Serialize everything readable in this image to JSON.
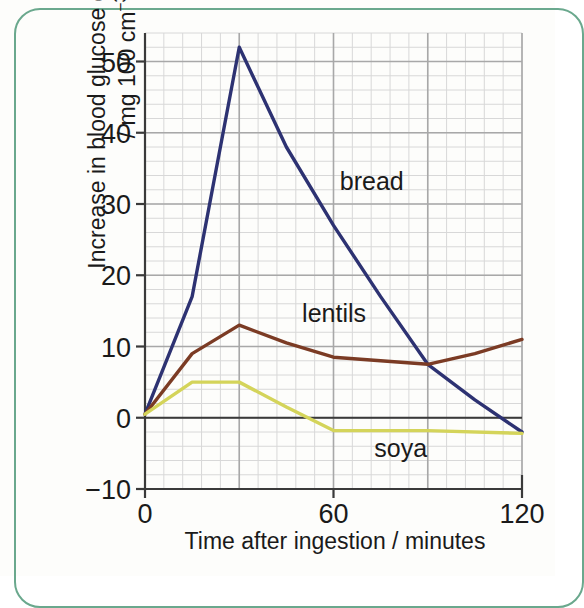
{
  "figure": {
    "frame_color": "#6aa88d",
    "background": "#fdfdfb"
  },
  "chart_data": {
    "type": "line",
    "title": "",
    "xlabel": "Time after ingestion / minutes",
    "ylabel_line1": "Increase in blood glucose concentration",
    "ylabel_line2_prefix": "/ mg 100 cm",
    "ylabel_line2_exponent": "−3",
    "x": [
      0,
      15,
      30,
      45,
      60,
      75,
      90,
      105,
      120
    ],
    "xlim": [
      0,
      120
    ],
    "ylim": [
      -10,
      54
    ],
    "xticks": [
      0,
      60,
      120
    ],
    "xtick_labels": [
      "0",
      "60",
      "120"
    ],
    "yticks": [
      -10,
      0,
      10,
      20,
      30,
      40,
      50
    ],
    "ytick_labels": [
      "−10",
      "0",
      "10",
      "20",
      "30",
      "40",
      "50"
    ],
    "grid": true,
    "grid_major_minutes": 30,
    "grid_minor_minutes": 6,
    "grid_major_units": 10,
    "grid_minor_units": 2,
    "legend_position": "inline-labels",
    "series": [
      {
        "name": "bread",
        "color": "#2d3272",
        "label_x": 62,
        "label_y": 32,
        "points": [
          {
            "x": 0,
            "y": 0.5
          },
          {
            "x": 15,
            "y": 17
          },
          {
            "x": 30,
            "y": 52
          },
          {
            "x": 45,
            "y": 38
          },
          {
            "x": 60,
            "y": 27
          },
          {
            "x": 75,
            "y": 17
          },
          {
            "x": 90,
            "y": 7.5
          },
          {
            "x": 105,
            "y": 2.5
          },
          {
            "x": 120,
            "y": -2
          }
        ]
      },
      {
        "name": "lentils",
        "color": "#7b3b24",
        "label_x": 50,
        "label_y": 13.5,
        "points": [
          {
            "x": 0,
            "y": 0.5
          },
          {
            "x": 15,
            "y": 9
          },
          {
            "x": 30,
            "y": 13
          },
          {
            "x": 45,
            "y": 10.5
          },
          {
            "x": 60,
            "y": 8.5
          },
          {
            "x": 75,
            "y": 8
          },
          {
            "x": 90,
            "y": 7.5
          },
          {
            "x": 105,
            "y": 9
          },
          {
            "x": 120,
            "y": 11
          }
        ]
      },
      {
        "name": "soya",
        "color": "#d4d45a",
        "label_x": 73,
        "label_y": -5.5,
        "points": [
          {
            "x": 0,
            "y": 0.5
          },
          {
            "x": 15,
            "y": 5
          },
          {
            "x": 30,
            "y": 5
          },
          {
            "x": 45,
            "y": 1.5
          },
          {
            "x": 60,
            "y": -1.8
          },
          {
            "x": 90,
            "y": -1.8
          },
          {
            "x": 120,
            "y": -2.2
          }
        ]
      }
    ]
  },
  "colors": {
    "axis": "#3a3a3a",
    "grid_major": "#a8a8a8",
    "grid_minor": "#d8d8d8",
    "text": "#1a1a1a"
  }
}
